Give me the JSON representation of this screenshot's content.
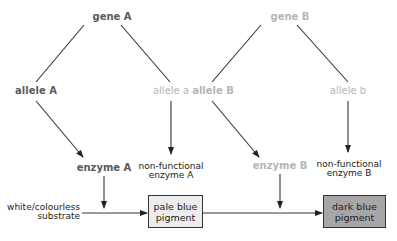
{
  "genes": {
    "gene_a": "gene A",
    "gene_b": "gene B"
  },
  "alleles": {
    "allele_A": "allele A",
    "allele_a": "allele a",
    "allele_B": "allele B",
    "allele_b": "allele b"
  },
  "enzymes": {
    "enzyme_A": "enzyme A",
    "nonfunctional_A_line1": "non-functional",
    "nonfunctional_A_line2": "enzyme A",
    "enzyme_B": "enzyme B",
    "nonfunctional_B_line1": "non-functional",
    "nonfunctional_B_line2": "enzyme B"
  },
  "pathway": {
    "substrate_line1": "white/colourless",
    "substrate_line2": "substrate",
    "pale_pigment_line1": "pale blue",
    "pale_pigment_line2": "pigment",
    "dark_pigment_line1": "dark blue",
    "dark_pigment_line2": "pigment"
  },
  "colors": {
    "pale_box_fill": "#ececec",
    "dark_box_fill": "#a6a6a6",
    "active_text": "#5a5a5a",
    "faded_text": "#b5b5b5"
  }
}
